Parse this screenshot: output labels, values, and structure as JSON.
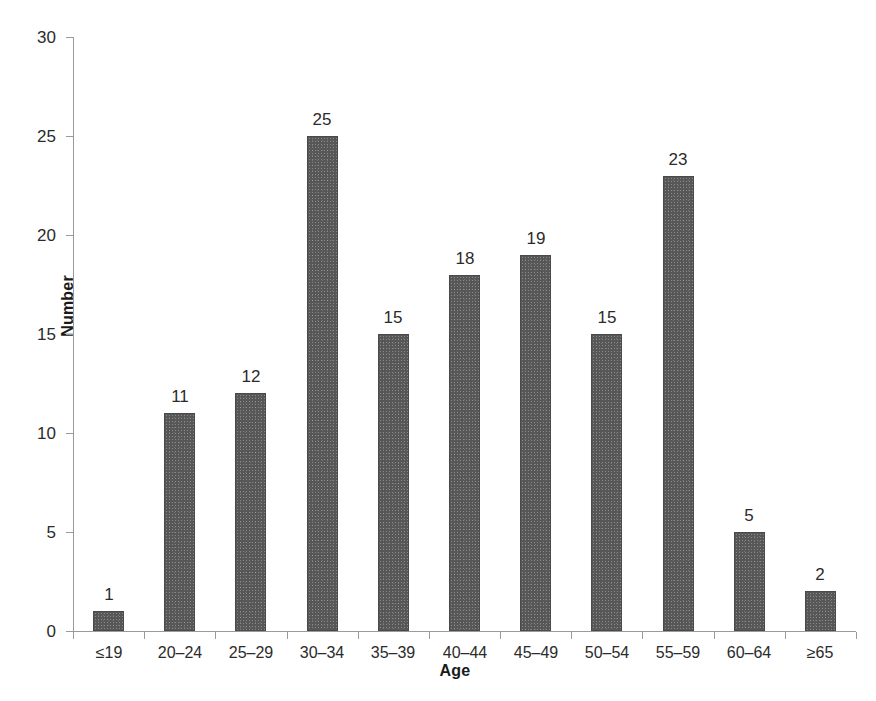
{
  "chart_data": {
    "type": "bar",
    "title": "",
    "subtitle": "",
    "xlabel": "Age",
    "ylabel": "Number",
    "categories": [
      "≤19",
      "20–24",
      "25–29",
      "30–34",
      "35–39",
      "40–44",
      "45–49",
      "50–54",
      "55–59",
      "60–64",
      "≥65"
    ],
    "values": [
      1,
      11,
      12,
      25,
      15,
      18,
      19,
      15,
      23,
      5,
      2
    ],
    "value_labels": [
      "1",
      "11",
      "12",
      "25",
      "15",
      "18",
      "19",
      "15",
      "23",
      "5",
      "2"
    ],
    "ylim": [
      0,
      30
    ],
    "ytick_labels": [
      "0",
      "5",
      "10",
      "15",
      "20",
      "25",
      "30"
    ],
    "ytick_values": [
      0,
      5,
      10,
      15,
      20,
      25,
      30
    ],
    "grid": false,
    "legend": false,
    "legend_position": "none",
    "bar_color": "#575757",
    "axis_color": "#9a9a9a",
    "text_color": "#2b2b2b",
    "background": "#ffffff"
  },
  "axes": {
    "y_title": "Number",
    "x_title": "Age"
  }
}
